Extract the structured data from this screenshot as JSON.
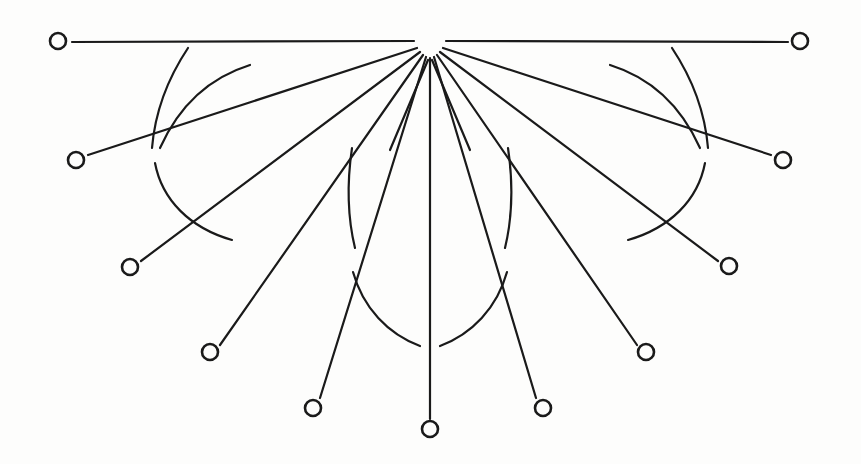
{
  "figure": {
    "kind": "line-drawing",
    "width": 861,
    "height": 464,
    "background_color": "#fdfdfc",
    "ink_color": "#1a1a1a",
    "apex": {
      "x": 430,
      "y": 42,
      "label": "apex-hub"
    },
    "node_radius": 8,
    "node_stroke_width": 2.6,
    "ray_stroke_width": 2.2,
    "arc_stroke_width": 2.2,
    "hub_gap_radius": 16,
    "node_count": 11,
    "ray_count": 13,
    "arc_count": 10
  },
  "nodes": [
    {
      "id": "node-left-1",
      "x": 58,
      "y": 41,
      "side": "left",
      "tier": 1
    },
    {
      "id": "node-left-2",
      "x": 76,
      "y": 160,
      "side": "left",
      "tier": 2
    },
    {
      "id": "node-left-3",
      "x": 130,
      "y": 267,
      "side": "left",
      "tier": 3
    },
    {
      "id": "node-left-4",
      "x": 210,
      "y": 352,
      "side": "left",
      "tier": 4
    },
    {
      "id": "node-left-5",
      "x": 313,
      "y": 408,
      "side": "left",
      "tier": 5
    },
    {
      "id": "node-center",
      "x": 430,
      "y": 429,
      "side": "center",
      "tier": 6
    },
    {
      "id": "node-right-5",
      "x": 543,
      "y": 408,
      "side": "right",
      "tier": 5
    },
    {
      "id": "node-right-4",
      "x": 646,
      "y": 352,
      "side": "right",
      "tier": 4
    },
    {
      "id": "node-right-3",
      "x": 729,
      "y": 266,
      "side": "right",
      "tier": 3
    },
    {
      "id": "node-right-2",
      "x": 783,
      "y": 160,
      "side": "right",
      "tier": 2
    },
    {
      "id": "node-right-1",
      "x": 800,
      "y": 41,
      "side": "right",
      "tier": 1
    }
  ],
  "rays": [
    {
      "id": "ray-left-1",
      "x1": 72,
      "y1": 42,
      "x2": 414,
      "y2": 41
    },
    {
      "id": "ray-left-1b",
      "x1": 88,
      "y1": 155,
      "x2": 417,
      "y2": 48
    },
    {
      "id": "ray-left-2",
      "x1": 141,
      "y1": 261,
      "x2": 420,
      "y2": 52
    },
    {
      "id": "ray-left-3",
      "x1": 220,
      "y1": 345,
      "x2": 423,
      "y2": 55
    },
    {
      "id": "ray-left-4",
      "x1": 320,
      "y1": 398,
      "x2": 426,
      "y2": 57
    },
    {
      "id": "ray-center",
      "x1": 430,
      "y1": 419,
      "x2": 430,
      "y2": 58
    },
    {
      "id": "ray-right-4",
      "x1": 536,
      "y1": 398,
      "x2": 434,
      "y2": 57
    },
    {
      "id": "ray-right-3",
      "x1": 637,
      "y1": 345,
      "x2": 437,
      "y2": 55
    },
    {
      "id": "ray-right-2",
      "x1": 718,
      "y1": 261,
      "x2": 440,
      "y2": 52
    },
    {
      "id": "ray-right-1b",
      "x1": 771,
      "y1": 155,
      "x2": 443,
      "y2": 48
    },
    {
      "id": "ray-right-1",
      "x1": 788,
      "y1": 42,
      "x2": 446,
      "y2": 41
    },
    {
      "id": "ray-inner-left",
      "x1": 390,
      "y1": 150,
      "x2": 428,
      "y2": 60
    },
    {
      "id": "ray-inner-right",
      "x1": 470,
      "y1": 150,
      "x2": 432,
      "y2": 60
    }
  ],
  "arcs": [
    {
      "id": "arc-outer-left-upper",
      "radius": 148,
      "start_deg": 243,
      "end_deg": 195
    },
    {
      "id": "arc-outer-left-lower",
      "radius": 148,
      "start_deg": 188,
      "end_deg": 139
    },
    {
      "id": "arc-outer-right-upper",
      "radius": 148,
      "start_deg": 297,
      "end_deg": 345
    },
    {
      "id": "arc-outer-right-lower",
      "radius": 148,
      "start_deg": 352,
      "end_deg": 41
    },
    {
      "id": "arc-mid-left",
      "radius": 117,
      "start_deg": 110,
      "end_deg": 133
    },
    {
      "id": "arc-mid-right",
      "radius": 117,
      "start_deg": 70,
      "end_deg": 47
    },
    {
      "id": "arc-inner-left",
      "radius": 305,
      "start_deg": 112,
      "end_deg": 88
    },
    {
      "id": "arc-inner-right",
      "radius": 305,
      "start_deg": 68,
      "end_deg": 92
    },
    {
      "id": "arc-far-left-top",
      "radius": 252,
      "start_deg": 212,
      "end_deg": 186
    },
    {
      "id": "arc-far-right-top",
      "radius": 252,
      "start_deg": 328,
      "end_deg": 354
    }
  ],
  "arc_paths": {
    "outer_left_upper": "M 250 65 C 208 78 178 108 160 148",
    "outer_left_lower": "M 155 163 C 162 200 190 228 232 240",
    "outer_right_upper": "M 610 65 C 652 78 682 108 700 148",
    "outer_right_lower": "M 705 163 C 698 200 670 228 628 240",
    "mid_left": "M 352 148 C 347 182 347 215 355 248",
    "mid_right": "M 508 148 C 513 182 513 215 505 248",
    "inner_left": "M 353 272 C 363 308 388 334 420 346",
    "inner_right": "M 507 272 C 497 308 472 334 440 346",
    "far_left_top": "M 188 48 C 168 78 155 112 152 148",
    "far_right_top": "M 672 48 C 692 78 705 112 708 148"
  }
}
